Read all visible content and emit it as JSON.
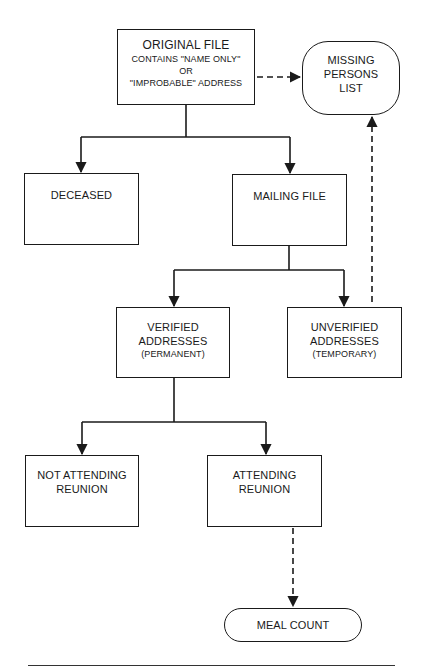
{
  "diagram": {
    "type": "flowchart",
    "colors": {
      "stroke": "#1a1a1a",
      "background": "#ffffff"
    },
    "nodes": {
      "original_file": {
        "lines": [
          "ORIGINAL FILE",
          "CONTAINS \"NAME ONLY\"",
          "OR",
          "\"IMPROBABLE\" ADDRESS"
        ],
        "shape": "rectangle"
      },
      "missing_persons": {
        "lines": [
          "MISSING",
          "PERSONS",
          "LIST"
        ],
        "shape": "rounded"
      },
      "deceased": {
        "lines": [
          "DECEASED"
        ],
        "shape": "rectangle"
      },
      "mailing_file": {
        "lines": [
          "MAILING FILE"
        ],
        "shape": "rectangle"
      },
      "verified": {
        "lines": [
          "VERIFIED",
          "ADDRESSES",
          "(PERMANENT)"
        ],
        "shape": "rectangle"
      },
      "unverified": {
        "lines": [
          "UNVERIFIED",
          "ADDRESSES",
          "(TEMPORARY)"
        ],
        "shape": "rectangle"
      },
      "not_attending": {
        "lines": [
          "NOT ATTENDING",
          "REUNION"
        ],
        "shape": "rectangle"
      },
      "attending": {
        "lines": [
          "ATTENDING",
          "REUNION"
        ],
        "shape": "rectangle"
      },
      "meal_count": {
        "lines": [
          "MEAL COUNT"
        ],
        "shape": "pill"
      }
    },
    "edges": [
      {
        "from": "original_file",
        "to": "missing_persons",
        "style": "dashed"
      },
      {
        "from": "original_file",
        "to": "deceased",
        "style": "solid"
      },
      {
        "from": "original_file",
        "to": "mailing_file",
        "style": "solid"
      },
      {
        "from": "mailing_file",
        "to": "verified",
        "style": "solid"
      },
      {
        "from": "mailing_file",
        "to": "unverified",
        "style": "solid"
      },
      {
        "from": "unverified",
        "to": "missing_persons",
        "style": "dashed"
      },
      {
        "from": "verified",
        "to": "not_attending",
        "style": "solid"
      },
      {
        "from": "verified",
        "to": "attending",
        "style": "solid"
      },
      {
        "from": "attending",
        "to": "meal_count",
        "style": "dashed"
      }
    ]
  }
}
